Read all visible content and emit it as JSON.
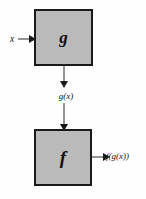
{
  "diagram": {
    "type": "flowchart",
    "nodes": [
      {
        "id": "g",
        "label": "g",
        "role": "inner-function-box",
        "fill": "#bababa",
        "border": "#1a1a1a"
      },
      {
        "id": "f",
        "label": "f",
        "role": "outer-function-box",
        "fill": "#bababa",
        "border": "#1a1a1a"
      }
    ],
    "labels": {
      "input": "x",
      "intermediate": "g(x)",
      "output": "f(g(x))"
    },
    "edges": [
      {
        "id": "input-to-g",
        "from": "x",
        "to": "g",
        "direction": "right"
      },
      {
        "id": "g-to-intermediate",
        "from": "g",
        "to": "g(x)",
        "direction": "down"
      },
      {
        "id": "intermediate-to-f",
        "from": "g(x)",
        "to": "f",
        "direction": "down"
      },
      {
        "id": "f-to-output",
        "from": "f",
        "to": "f(g(x))",
        "direction": "right"
      }
    ],
    "colors": {
      "background": "#fefefe",
      "box_fill": "#bababa",
      "box_border": "#1a1a1a",
      "arrow": "#2b2b2b",
      "text": "#121212"
    }
  }
}
